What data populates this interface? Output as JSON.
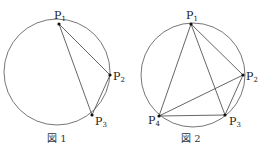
{
  "figures": [
    {
      "caption": "図 1",
      "circle": {
        "cx": 57,
        "cy": 72,
        "r": 53
      },
      "points": [
        {
          "name": "P",
          "sub": "1",
          "x": 59,
          "y": 24
        },
        {
          "name": "P",
          "sub": "2",
          "x": 110,
          "y": 75
        },
        {
          "name": "P",
          "sub": "3",
          "x": 92,
          "y": 115
        }
      ],
      "segments": [
        [
          "P1",
          "P2"
        ],
        [
          "P1",
          "P3"
        ],
        [
          "P2",
          "P3"
        ]
      ]
    },
    {
      "caption": "図 2",
      "circle": {
        "cx": 193,
        "cy": 75,
        "r": 52
      },
      "points": [
        {
          "name": "P",
          "sub": "1",
          "x": 191,
          "y": 24
        },
        {
          "name": "P",
          "sub": "2",
          "x": 243,
          "y": 75
        },
        {
          "name": "P",
          "sub": "3",
          "x": 225,
          "y": 115
        },
        {
          "name": "P",
          "sub": "4",
          "x": 159,
          "y": 116
        }
      ],
      "segments": [
        [
          "P1",
          "P2"
        ],
        [
          "P1",
          "P3"
        ],
        [
          "P1",
          "P4"
        ],
        [
          "P2",
          "P3"
        ],
        [
          "P2",
          "P4"
        ],
        [
          "P3",
          "P4"
        ]
      ]
    }
  ],
  "colors": {
    "stroke": "#555555",
    "point": "#111111"
  }
}
